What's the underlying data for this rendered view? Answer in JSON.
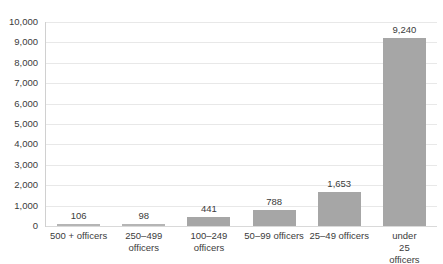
{
  "chart_data": {
    "type": "bar",
    "title": "",
    "xlabel": "",
    "ylabel": "",
    "ylim": [
      0,
      10000
    ],
    "grid": true,
    "legend": false,
    "orientation": "vertical",
    "bar_color": "#A6A6A6",
    "categories": [
      "500 + officers",
      "250–499 officers",
      "100–249 officers",
      "50–99 officers",
      "25–49 officers",
      "under 25 officers"
    ],
    "category_lines": [
      [
        "500 + officers"
      ],
      [
        "250–499",
        "officers"
      ],
      [
        "100–249",
        "officers"
      ],
      [
        "50–99 officers"
      ],
      [
        "25–49 officers"
      ],
      [
        "under 25",
        "officers"
      ]
    ],
    "values": [
      106,
      98,
      441,
      788,
      1653,
      9240
    ],
    "value_labels": [
      "106",
      "98",
      "441",
      "788",
      "1,653",
      "9,240"
    ],
    "ytick_values": [
      0,
      1000,
      2000,
      3000,
      4000,
      5000,
      6000,
      7000,
      8000,
      9000,
      10000
    ],
    "ytick_labels": [
      "0",
      "1,000",
      "2,000",
      "3,000",
      "4,000",
      "5,000",
      "6,000",
      "7,000",
      "8,000",
      "9,000",
      "10,000"
    ]
  }
}
